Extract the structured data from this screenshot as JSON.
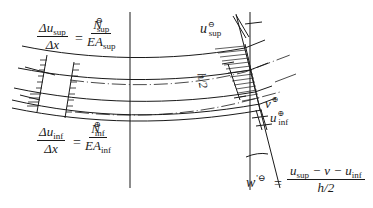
{
  "figure": {
    "type": "beam curvature / strain diagram",
    "colors": {
      "ink": "#1a1a1a",
      "background": "#ffffff"
    }
  },
  "equations": {
    "top_left": {
      "lhs_num": "Δu",
      "lhs_num_sub": "sup",
      "lhs_den": "Δx",
      "equals": "=",
      "rhs_num": "N",
      "rhs_num_sup": "⊖",
      "rhs_num_sub": "sup",
      "rhs_den": "EA",
      "rhs_den_sub": "sup"
    },
    "bottom_left": {
      "lhs_num": "Δu",
      "lhs_num_sub": "inf",
      "lhs_den": "Δx",
      "equals": "=",
      "rhs_num": "N",
      "rhs_num_sup": "⊕",
      "rhs_num_sub": "inf",
      "rhs_den": "EA",
      "rhs_den_sub": "inf"
    },
    "rotation": {
      "lhs": "w",
      "lhs_sup": "'⊖",
      "equals": "=",
      "num": "u",
      "num_sub1": "sup",
      "num_mid": " − v − ",
      "num_u2": "u",
      "num_sub2": "inf",
      "den": "h/2"
    }
  },
  "labels": {
    "u_sup": {
      "base": "u",
      "sup": "⊖",
      "sub": "sup"
    },
    "v": {
      "base": "v",
      "sup": "⊕"
    },
    "u_inf": {
      "base": "u",
      "sup": "⊕",
      "sub": "inf"
    },
    "h_half": "h/2"
  }
}
